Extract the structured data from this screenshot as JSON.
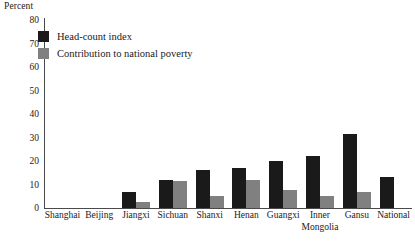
{
  "chart_data": {
    "type": "bar",
    "title": "",
    "subtitle": "",
    "xlabel": "",
    "ylabel": "Percent",
    "ylim": [
      0,
      80
    ],
    "ytick_step": 10,
    "yticks": [
      0,
      10,
      20,
      30,
      40,
      50,
      60,
      70,
      80
    ],
    "grid": false,
    "legend_position": "top-left",
    "categories": [
      "Shanghai",
      "Beijing",
      "Jiangxi",
      "Sichuan",
      "Shanxi",
      "Henan",
      "Guangxi",
      "Inner Mongolia",
      "Gansu",
      "National"
    ],
    "series": [
      {
        "name": "Head-count index",
        "color": "#1a1a1a",
        "values": [
          0,
          0,
          7,
          12,
          16,
          17,
          20,
          22,
          31.5,
          13
        ]
      },
      {
        "name": "Contribution to national poverty",
        "color": "#808080",
        "values": [
          0,
          0,
          2.5,
          11.5,
          5,
          12,
          7.5,
          5,
          7,
          0
        ]
      }
    ]
  },
  "colors": {
    "axis": "#4a4a4a",
    "text": "#1a1a1a",
    "background": "#ffffff",
    "series_head_count": "#1a1a1a",
    "series_contribution": "#808080"
  }
}
